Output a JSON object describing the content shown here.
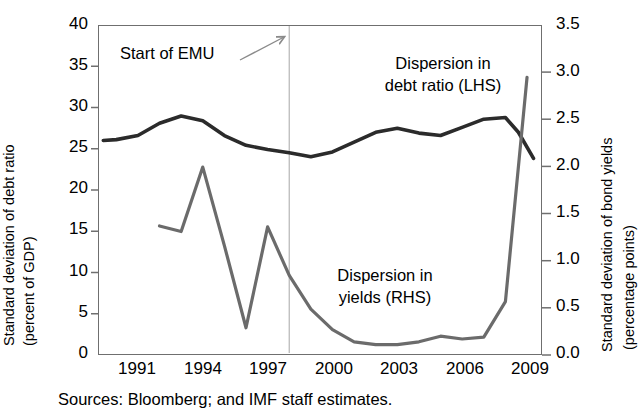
{
  "axes": {
    "left_title_line1": "Standard deviation of debt ratio",
    "left_title_line2": "(percent of GDP)",
    "right_title_line1": "Standard deviation of  bond yields",
    "right_title_line2": "(percentage points)",
    "left_ticks": [
      "0",
      "5",
      "10",
      "15",
      "20",
      "25",
      "30",
      "35",
      "40"
    ],
    "right_ticks": [
      "0.0",
      "0.5",
      "1.0",
      "1.5",
      "2.0",
      "2.5",
      "3.0",
      "3.5"
    ],
    "x_ticks": [
      "1991",
      "1994",
      "1997",
      "2000",
      "2003",
      "2006",
      "2009"
    ]
  },
  "annotations": {
    "emu": "Start of EMU",
    "debt_l1": "Dispersion in",
    "debt_l2": "debt ratio (LHS)",
    "yields_l1": "Dispersion in",
    "yields_l2": "yields (RHS)"
  },
  "source": "Sources: Bloomberg; and IMF staff estimates.",
  "colors": {
    "debt_line": "#2b2b2b",
    "yield_line": "#6b6b6b",
    "axis": "#6f6f6f",
    "emu_line": "#b5b5b5"
  },
  "chart_data": {
    "type": "line",
    "title": "",
    "xlabel": "",
    "ylabel": "Standard deviation of debt ratio (percent of GDP)",
    "y2label": "Standard deviation of  bond yields (percentage points)",
    "xlim": [
      1990.2,
      2010.6
    ],
    "ylim": [
      0,
      40
    ],
    "y2lim": [
      0.0,
      3.5
    ],
    "grid": false,
    "legend": "annotations-inline",
    "x": [
      1991,
      1992,
      1993,
      1994,
      1995,
      1996,
      1997,
      1998,
      1999,
      2000,
      2001,
      2002,
      2003,
      2004,
      2005,
      2006,
      2007,
      2008,
      2009,
      2010
    ],
    "series": [
      {
        "name": "Dispersion in debt ratio (LHS)",
        "axis": "left",
        "units": "percent of GDP",
        "color": "#2b2b2b",
        "x": [
          1990.4,
          1991,
          1992,
          1993,
          1994,
          1995,
          1996,
          1997,
          1998,
          1999,
          2000,
          2001,
          2002,
          2003,
          2004,
          2005,
          2006,
          2007,
          2008,
          2009,
          2009.6,
          2010.3
        ],
        "values": [
          26.0,
          26.1,
          26.6,
          28.1,
          29.0,
          28.4,
          26.6,
          25.4,
          24.9,
          24.5,
          24.0,
          24.6,
          25.8,
          27.0,
          27.5,
          26.9,
          26.6,
          27.6,
          28.6,
          28.8,
          27.0,
          23.8
        ]
      },
      {
        "name": "Dispersion in yields (RHS)",
        "axis": "right",
        "units": "percentage points",
        "color": "#6b6b6b",
        "x": [
          1993,
          1994,
          1995,
          1996,
          1997,
          1998,
          1999,
          2000,
          2001,
          2002,
          2003,
          2004,
          2005,
          2006,
          2007,
          2008,
          2009,
          2010
        ],
        "values": [
          1.36,
          1.3,
          1.99,
          1.15,
          0.27,
          1.35,
          0.83,
          0.47,
          0.25,
          0.12,
          0.09,
          0.09,
          0.12,
          0.18,
          0.15,
          0.17,
          0.55,
          2.95
        ]
      }
    ],
    "annotations": [
      {
        "text": "Start of EMU",
        "x": 1999,
        "kind": "vertical-marker-with-arrow"
      }
    ]
  }
}
